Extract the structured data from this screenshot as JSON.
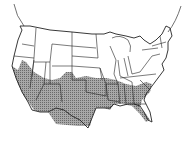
{
  "map": {
    "type": "range-map",
    "region": "Contiguous United States",
    "projection": "curved graticule (Albers-like)",
    "colors": {
      "background": "#ffffff",
      "state_outline": "#2a2a2a",
      "range_fill": "#9a9a9a",
      "range_hatch": "#5e5e5e"
    },
    "range": {
      "description": "Shaded distribution covering the southern tier of states",
      "states_shaded": [
        "California (south)",
        "Arizona",
        "New Mexico",
        "Texas",
        "Oklahoma",
        "Kansas (south)",
        "Colorado (southeast)",
        "Utah (south)",
        "Nevada (south)",
        "Arkansas",
        "Louisiana (north)",
        "Mississippi",
        "Alabama",
        "Georgia",
        "South Carolina",
        "North Carolina (south)",
        "Tennessee (south)",
        "Florida (north)"
      ]
    }
  }
}
